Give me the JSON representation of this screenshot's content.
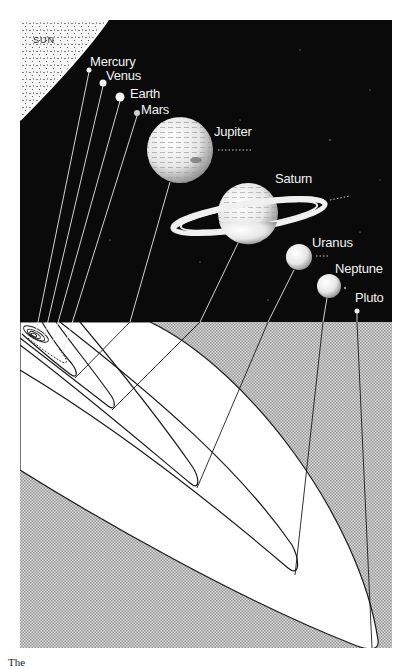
{
  "figure": {
    "type": "solar-system-orbits-illustration",
    "sun_label": "SUN",
    "caption_partial": "The"
  },
  "colors": {
    "space": "#0a0a0a",
    "orbit_plane": "#c9c9c9",
    "orbit_fill": "#ffffff",
    "orbit_line": "#1a1a1a",
    "sun": "#f4f4f4",
    "label": "#f2f2f2"
  },
  "planets": [
    {
      "name": "Mercury",
      "x": 89,
      "y": 70,
      "r": 2.5,
      "label_x": 90,
      "label_y": 55,
      "orbit_tip_x": 36,
      "orbit_tip_y": 332
    },
    {
      "name": "Venus",
      "x": 103,
      "y": 83,
      "r": 3.5,
      "label_x": 106,
      "label_y": 69,
      "orbit_tip_x": 44,
      "orbit_tip_y": 338
    },
    {
      "name": "Earth",
      "x": 120,
      "y": 97,
      "r": 4.5,
      "label_x": 130,
      "label_y": 87,
      "orbit_tip_x": 52,
      "orbit_tip_y": 344
    },
    {
      "name": "Mars",
      "x": 137,
      "y": 113,
      "r": 3,
      "label_x": 141,
      "label_y": 103,
      "orbit_tip_x": 63,
      "orbit_tip_y": 352
    },
    {
      "name": "Jupiter",
      "x": 180,
      "y": 150,
      "r": 33,
      "label_x": 214,
      "label_y": 125,
      "orbit_tip_x": 75,
      "orbit_tip_y": 378
    },
    {
      "name": "Saturn",
      "x": 248,
      "y": 213,
      "r": 30,
      "label_x": 275,
      "label_y": 172,
      "orbit_tip_x": 112,
      "orbit_tip_y": 410
    },
    {
      "name": "Uranus",
      "x": 299,
      "y": 257,
      "r": 13,
      "label_x": 312,
      "label_y": 236,
      "orbit_tip_x": 197,
      "orbit_tip_y": 488
    },
    {
      "name": "Neptune",
      "x": 329,
      "y": 286,
      "r": 12,
      "label_x": 335,
      "label_y": 262,
      "orbit_tip_x": 295,
      "orbit_tip_y": 575
    },
    {
      "name": "Pluto",
      "x": 357,
      "y": 311,
      "r": 2.5,
      "label_x": 355,
      "label_y": 291,
      "orbit_tip_x": 372,
      "orbit_tip_y": 648
    }
  ]
}
